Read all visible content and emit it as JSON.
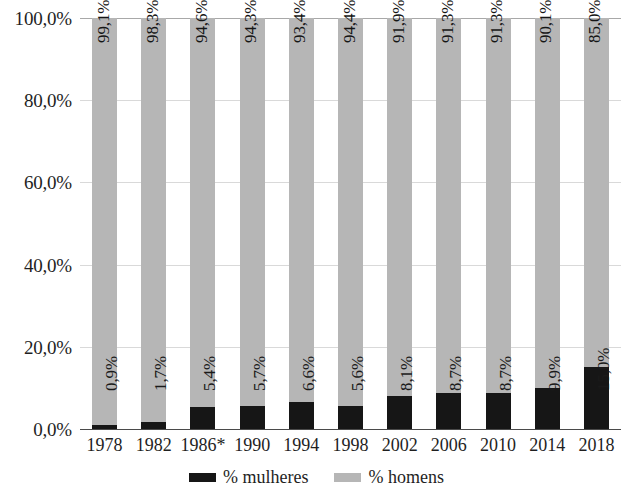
{
  "chart_data": {
    "type": "bar",
    "subtype": "stacked-100-percent",
    "title": "",
    "xlabel": "",
    "ylabel": "",
    "ylim": [
      0,
      100
    ],
    "ytick_labels": [
      "0,0%",
      "20,0%",
      "40,0%",
      "60,0%",
      "80,0%",
      "100,0%"
    ],
    "ytick_values": [
      0,
      20,
      40,
      60,
      80,
      100
    ],
    "grid": true,
    "legend_position": "bottom",
    "categories": [
      "1978",
      "1982",
      "1986*",
      "1990",
      "1994",
      "1998",
      "2002",
      "2006",
      "2010",
      "2014",
      "2018"
    ],
    "series": [
      {
        "name": "% mulheres",
        "color": "#161616",
        "values": [
          0.9,
          1.7,
          5.4,
          5.7,
          6.6,
          5.6,
          8.1,
          8.7,
          8.7,
          9.9,
          15.0
        ],
        "labels": [
          "0,9%",
          "1,7%",
          "5,4%",
          "5,7%",
          "6,6%",
          "5,6%",
          "8,1%",
          "8,7%",
          "8,7%",
          "9,9%",
          "15,0%"
        ]
      },
      {
        "name": "% homens",
        "color": "#b6b6b6",
        "values": [
          99.1,
          98.3,
          94.6,
          94.3,
          93.4,
          94.4,
          91.9,
          91.3,
          91.3,
          90.1,
          85.0
        ],
        "labels": [
          "99,1%",
          "98,3%",
          "94,6%",
          "94,3%",
          "93,4%",
          "94,4%",
          "91,9%",
          "91,3%",
          "91,3%",
          "90,1%",
          "85,0%"
        ]
      }
    ]
  },
  "legend": {
    "items": [
      {
        "label": "% mulheres",
        "color": "#161616"
      },
      {
        "label": "% homens",
        "color": "#b6b6b6"
      }
    ]
  },
  "colors": {
    "mulheres": "#161616",
    "homens": "#b6b6b6",
    "gridline": "#d9d9d9",
    "axis": "#4a4a4a",
    "text": "#1f1f1f",
    "background": "#ffffff"
  }
}
